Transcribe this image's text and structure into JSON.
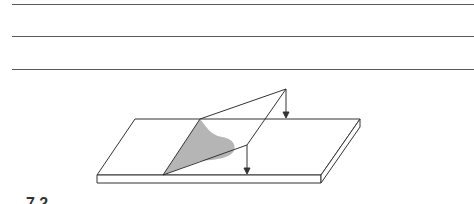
{
  "answer_lines": {
    "count": 3,
    "y_positions": [
      4,
      36,
      69
    ]
  },
  "figure": {
    "colors": {
      "stroke": "#333333",
      "adhesive_fill": "#b5b5b5",
      "plate_fill": "#ffffff"
    },
    "arrows": [
      {
        "name": "peel-force-arrow-top",
        "from": [
          286,
          89
        ],
        "to": [
          286,
          118
        ]
      },
      {
        "name": "peel-force-arrow-bottom",
        "from": [
          247,
          145
        ],
        "to": [
          247,
          175
        ]
      }
    ]
  },
  "caption": {
    "text": "7.2"
  }
}
